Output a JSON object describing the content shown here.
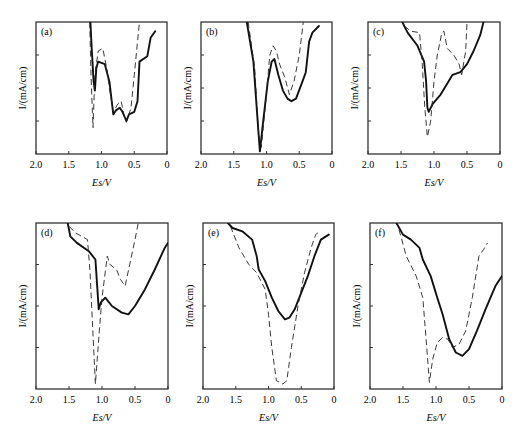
{
  "figure": {
    "y_axis_label": "I/(mA/cm)",
    "x_axis_label": "Es/V",
    "x_ticks": [
      "2.0",
      "1.5",
      "1.0",
      "0.5",
      "0"
    ]
  },
  "chart_data": [
    {
      "type": "line",
      "panel": "(a)",
      "xlabel": "Es/V",
      "ylabel": "I/(mA/cm)",
      "xlim": [
        2.0,
        0
      ],
      "x_ticks": [
        "2.0",
        "1.5",
        "1.0",
        "0.5",
        "0"
      ],
      "y_ticks_labeled": false,
      "series": [
        {
          "name": "solid",
          "style": "solid",
          "points": [
            [
              1.17,
              1.0
            ],
            [
              1.15,
              0.8
            ],
            [
              1.12,
              0.55
            ],
            [
              1.1,
              0.48
            ],
            [
              1.08,
              0.65
            ],
            [
              1.05,
              0.7
            ],
            [
              0.95,
              0.68
            ],
            [
              0.88,
              0.55
            ],
            [
              0.82,
              0.3
            ],
            [
              0.78,
              0.33
            ],
            [
              0.72,
              0.35
            ],
            [
              0.68,
              0.32
            ],
            [
              0.62,
              0.25
            ],
            [
              0.58,
              0.3
            ],
            [
              0.5,
              0.32
            ],
            [
              0.45,
              0.4
            ],
            [
              0.42,
              0.7
            ],
            [
              0.3,
              0.74
            ],
            [
              0.25,
              0.88
            ],
            [
              0.18,
              0.93
            ]
          ]
        },
        {
          "name": "dashed",
          "style": "dashed",
          "points": [
            [
              1.18,
              1.0
            ],
            [
              1.16,
              0.6
            ],
            [
              1.13,
              0.2
            ],
            [
              1.1,
              0.6
            ],
            [
              1.05,
              0.78
            ],
            [
              0.98,
              0.8
            ],
            [
              0.92,
              0.65
            ],
            [
              0.88,
              0.5
            ],
            [
              0.82,
              0.32
            ],
            [
              0.75,
              0.38
            ],
            [
              0.7,
              0.4
            ],
            [
              0.66,
              0.3
            ],
            [
              0.62,
              0.24
            ],
            [
              0.55,
              0.35
            ],
            [
              0.5,
              0.6
            ],
            [
              0.45,
              0.85
            ],
            [
              0.42,
              1.0
            ]
          ]
        }
      ]
    },
    {
      "type": "line",
      "panel": "(b)",
      "xlabel": "Es/V",
      "ylabel": "I/(mA/cm)",
      "xlim": [
        2.0,
        0
      ],
      "x_ticks": [
        "2.0",
        "1.5",
        "1.0",
        "0.5",
        "0"
      ],
      "y_ticks_labeled": false,
      "series": [
        {
          "name": "solid",
          "style": "solid",
          "points": [
            [
              1.3,
              1.0
            ],
            [
              1.2,
              0.7
            ],
            [
              1.12,
              0.15
            ],
            [
              1.1,
              0.02
            ],
            [
              1.05,
              0.25
            ],
            [
              0.98,
              0.55
            ],
            [
              0.92,
              0.7
            ],
            [
              0.88,
              0.72
            ],
            [
              0.82,
              0.6
            ],
            [
              0.75,
              0.48
            ],
            [
              0.68,
              0.42
            ],
            [
              0.62,
              0.4
            ],
            [
              0.55,
              0.42
            ],
            [
              0.45,
              0.55
            ],
            [
              0.4,
              0.62
            ],
            [
              0.35,
              0.85
            ],
            [
              0.3,
              0.92
            ],
            [
              0.2,
              0.97
            ]
          ]
        },
        {
          "name": "dashed",
          "style": "dashed",
          "points": [
            [
              1.28,
              1.0
            ],
            [
              1.18,
              0.65
            ],
            [
              1.12,
              0.15
            ],
            [
              1.08,
              0.05
            ],
            [
              1.02,
              0.35
            ],
            [
              0.95,
              0.75
            ],
            [
              0.9,
              0.82
            ],
            [
              0.85,
              0.78
            ],
            [
              0.8,
              0.68
            ],
            [
              0.72,
              0.58
            ],
            [
              0.65,
              0.45
            ],
            [
              0.58,
              0.55
            ],
            [
              0.5,
              0.75
            ],
            [
              0.45,
              0.95
            ],
            [
              0.44,
              1.0
            ]
          ]
        }
      ]
    },
    {
      "type": "line",
      "panel": "(c)",
      "xlabel": "Es/V",
      "ylabel": "I/(mA/cm)",
      "xlim": [
        2.0,
        0
      ],
      "x_ticks": [
        "2.0",
        "1.5",
        "1.0",
        "0.5",
        "0"
      ],
      "y_ticks_labeled": false,
      "series": [
        {
          "name": "solid",
          "style": "solid",
          "points": [
            [
              1.48,
              1.0
            ],
            [
              1.4,
              0.92
            ],
            [
              1.25,
              0.82
            ],
            [
              1.15,
              0.7
            ],
            [
              1.12,
              0.55
            ],
            [
              1.1,
              0.35
            ],
            [
              1.08,
              0.32
            ],
            [
              1.02,
              0.38
            ],
            [
              0.9,
              0.45
            ],
            [
              0.78,
              0.55
            ],
            [
              0.72,
              0.6
            ],
            [
              0.6,
              0.62
            ],
            [
              0.5,
              0.68
            ],
            [
              0.4,
              0.78
            ],
            [
              0.3,
              0.9
            ],
            [
              0.25,
              1.0
            ]
          ]
        },
        {
          "name": "dashed",
          "style": "dashed",
          "points": [
            [
              1.45,
              0.97
            ],
            [
              1.35,
              0.93
            ],
            [
              1.22,
              0.92
            ],
            [
              1.18,
              0.7
            ],
            [
              1.14,
              0.35
            ],
            [
              1.1,
              0.13
            ],
            [
              1.05,
              0.25
            ],
            [
              1.0,
              0.55
            ],
            [
              0.95,
              0.75
            ],
            [
              0.88,
              0.92
            ],
            [
              0.85,
              0.93
            ],
            [
              0.8,
              0.8
            ],
            [
              0.7,
              0.75
            ],
            [
              0.62,
              0.68
            ],
            [
              0.58,
              0.6
            ],
            [
              0.52,
              0.78
            ],
            [
              0.5,
              1.0
            ]
          ]
        }
      ]
    },
    {
      "type": "line",
      "panel": "(d)",
      "xlabel": "Es/V",
      "ylabel": "I/(mA/cm)",
      "xlim": [
        2.0,
        0
      ],
      "x_ticks": [
        "2.0",
        "1.5",
        "1.0",
        "0.5",
        "0"
      ],
      "y_ticks_labeled": false,
      "series": [
        {
          "name": "solid",
          "style": "solid",
          "points": [
            [
              1.52,
              1.0
            ],
            [
              1.48,
              0.92
            ],
            [
              1.38,
              0.88
            ],
            [
              1.2,
              0.83
            ],
            [
              1.1,
              0.78
            ],
            [
              1.07,
              0.6
            ],
            [
              1.05,
              0.48
            ],
            [
              1.02,
              0.52
            ],
            [
              0.95,
              0.55
            ],
            [
              0.85,
              0.5
            ],
            [
              0.7,
              0.46
            ],
            [
              0.6,
              0.45
            ],
            [
              0.5,
              0.5
            ],
            [
              0.35,
              0.6
            ],
            [
              0.2,
              0.72
            ],
            [
              0.05,
              0.85
            ],
            [
              0.0,
              0.88
            ]
          ]
        },
        {
          "name": "dashed",
          "style": "dashed",
          "points": [
            [
              1.5,
              0.98
            ],
            [
              1.4,
              0.94
            ],
            [
              1.22,
              0.9
            ],
            [
              1.18,
              0.7
            ],
            [
              1.14,
              0.35
            ],
            [
              1.1,
              0.03
            ],
            [
              1.05,
              0.3
            ],
            [
              1.0,
              0.55
            ],
            [
              0.92,
              0.8
            ],
            [
              0.88,
              0.75
            ],
            [
              0.78,
              0.72
            ],
            [
              0.72,
              0.66
            ],
            [
              0.65,
              0.62
            ],
            [
              0.58,
              0.75
            ],
            [
              0.5,
              0.9
            ],
            [
              0.45,
              1.0
            ]
          ]
        }
      ]
    },
    {
      "type": "line",
      "panel": "(e)",
      "xlabel": "Es/V",
      "ylabel": "I/(mA/cm)",
      "xlim": [
        2.0,
        0
      ],
      "x_ticks": [
        "2.0",
        "1.5",
        "1.0",
        "0.5",
        "0"
      ],
      "y_ticks_labeled": false,
      "series": [
        {
          "name": "solid",
          "style": "solid",
          "points": [
            [
              1.62,
              1.0
            ],
            [
              1.55,
              0.97
            ],
            [
              1.4,
              0.95
            ],
            [
              1.25,
              0.9
            ],
            [
              1.18,
              0.8
            ],
            [
              1.15,
              0.72
            ],
            [
              1.05,
              0.65
            ],
            [
              0.95,
              0.55
            ],
            [
              0.85,
              0.47
            ],
            [
              0.75,
              0.42
            ],
            [
              0.68,
              0.43
            ],
            [
              0.6,
              0.48
            ],
            [
              0.5,
              0.58
            ],
            [
              0.4,
              0.68
            ],
            [
              0.3,
              0.8
            ],
            [
              0.2,
              0.9
            ],
            [
              0.08,
              0.93
            ]
          ]
        },
        {
          "name": "dashed",
          "style": "dashed",
          "points": [
            [
              1.58,
              0.98
            ],
            [
              1.45,
              0.85
            ],
            [
              1.3,
              0.75
            ],
            [
              1.18,
              0.7
            ],
            [
              1.05,
              0.6
            ],
            [
              1.0,
              0.45
            ],
            [
              0.95,
              0.25
            ],
            [
              0.88,
              0.05
            ],
            [
              0.78,
              0.03
            ],
            [
              0.72,
              0.05
            ],
            [
              0.65,
              0.25
            ],
            [
              0.55,
              0.5
            ],
            [
              0.45,
              0.7
            ],
            [
              0.35,
              0.85
            ],
            [
              0.28,
              0.93
            ],
            [
              0.22,
              0.95
            ]
          ]
        }
      ]
    },
    {
      "type": "line",
      "panel": "(f)",
      "xlabel": "Es/V",
      "ylabel": "I/(mA/cm)",
      "xlim": [
        2.0,
        0
      ],
      "x_ticks": [
        "2.0",
        "1.5",
        "1.0",
        "0.5",
        "0"
      ],
      "y_ticks_labeled": false,
      "series": [
        {
          "name": "solid",
          "style": "solid",
          "points": [
            [
              1.6,
              1.0
            ],
            [
              1.5,
              0.93
            ],
            [
              1.38,
              0.9
            ],
            [
              1.25,
              0.85
            ],
            [
              1.2,
              0.78
            ],
            [
              1.08,
              0.68
            ],
            [
              0.98,
              0.55
            ],
            [
              0.9,
              0.45
            ],
            [
              0.8,
              0.3
            ],
            [
              0.7,
              0.22
            ],
            [
              0.6,
              0.2
            ],
            [
              0.5,
              0.24
            ],
            [
              0.38,
              0.35
            ],
            [
              0.25,
              0.48
            ],
            [
              0.1,
              0.62
            ],
            [
              0.0,
              0.68
            ]
          ]
        },
        {
          "name": "dashed",
          "style": "dashed",
          "points": [
            [
              1.56,
              0.96
            ],
            [
              1.45,
              0.8
            ],
            [
              1.3,
              0.68
            ],
            [
              1.2,
              0.55
            ],
            [
              1.15,
              0.3
            ],
            [
              1.1,
              0.04
            ],
            [
              1.05,
              0.18
            ],
            [
              0.98,
              0.28
            ],
            [
              0.9,
              0.31
            ],
            [
              0.82,
              0.3
            ],
            [
              0.75,
              0.25
            ],
            [
              0.65,
              0.27
            ],
            [
              0.55,
              0.35
            ],
            [
              0.45,
              0.55
            ],
            [
              0.35,
              0.8
            ],
            [
              0.28,
              0.84
            ],
            [
              0.22,
              0.88
            ]
          ]
        }
      ]
    }
  ],
  "panels": [
    {
      "label": "(a)",
      "ylabel": "I/(mA/cm)",
      "xlabel": "Es/V"
    },
    {
      "label": "(b)",
      "ylabel": "I/(mA/cm)",
      "xlabel": "Es/V"
    },
    {
      "label": "(c)",
      "ylabel": "I/(mA/cm)",
      "xlabel": "Es/V"
    },
    {
      "label": "(d)",
      "ylabel": "I/(mA/cm)",
      "xlabel": "Es/V"
    },
    {
      "label": "(e)",
      "ylabel": "I/(mA/cm)",
      "xlabel": "Es/V"
    },
    {
      "label": "(f)",
      "ylabel": "I/(mA/cm)",
      "xlabel": "Es/V"
    }
  ]
}
